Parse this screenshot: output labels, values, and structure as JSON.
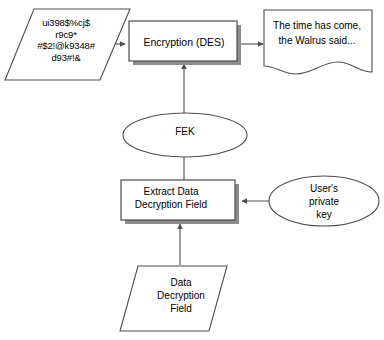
{
  "diagram": {
    "colors": {
      "stroke": "#4d4d4d",
      "node_fill": "#ffffff",
      "shadow": "#8c8c8c",
      "text": "#000000",
      "background": "#ffffff"
    },
    "nodes": [
      {
        "id": "ciphertext",
        "shape": "parallelogram",
        "label": "ui398$%cj$\nr9c9*\n#$2!@k9348#\nd93#!&",
        "role": "encrypted-data-input"
      },
      {
        "id": "encryption",
        "shape": "process-box-shadowed",
        "label": "Encryption (DES)",
        "role": "encryption-process"
      },
      {
        "id": "plaintext",
        "shape": "document",
        "label": "The time has come,\nthe Walrus said...",
        "role": "decrypted-document-output"
      },
      {
        "id": "fek",
        "shape": "ellipse",
        "label": "FEK",
        "role": "file-encryption-key"
      },
      {
        "id": "extract",
        "shape": "process-box-shadowed",
        "label": "Extract Data\nDecryption Field",
        "role": "extract-ddf-process"
      },
      {
        "id": "private-key",
        "shape": "ellipse",
        "label": "User's\nprivate\nkey",
        "role": "user-private-key"
      },
      {
        "id": "ddf",
        "shape": "parallelogram",
        "label": "Data\nDecryption\nField",
        "role": "data-decryption-field-input"
      }
    ],
    "edges": [
      {
        "id": "ciphertext-to-encryption",
        "from": "ciphertext",
        "to": "encryption",
        "arrow": true,
        "direction": "right"
      },
      {
        "id": "encryption-to-plaintext",
        "from": "encryption",
        "to": "plaintext",
        "arrow": true,
        "direction": "right"
      },
      {
        "id": "fek-to-encryption",
        "from": "fek",
        "to": "encryption",
        "arrow": true,
        "direction": "up"
      },
      {
        "id": "extract-to-fek",
        "from": "extract",
        "to": "fek",
        "arrow": false,
        "direction": "up"
      },
      {
        "id": "private-key-to-extract",
        "from": "private-key",
        "to": "extract",
        "arrow": true,
        "direction": "left"
      },
      {
        "id": "ddf-to-extract",
        "from": "ddf",
        "to": "extract",
        "arrow": true,
        "direction": "up"
      }
    ]
  }
}
